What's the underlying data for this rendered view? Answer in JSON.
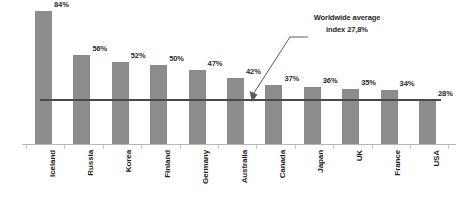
{
  "chart_data": {
    "type": "bar",
    "title": "",
    "subtitle": "",
    "xlabel": "",
    "ylabel": "",
    "ylim": [
      0,
      90
    ],
    "grid": false,
    "legend": null,
    "value_suffix": "%",
    "categories": [
      "Iceland",
      "Russia",
      "Korea",
      "Finland",
      "Germany",
      "Australia",
      "Canada",
      "Japan",
      "UK",
      "France",
      "USA"
    ],
    "values": [
      84,
      56,
      52,
      50,
      47,
      42,
      37,
      36,
      35,
      34,
      28
    ],
    "data_labels": [
      "84%",
      "56%",
      "52%",
      "50%",
      "47%",
      "42%",
      "37%",
      "36%",
      "35%",
      "34%",
      "28%"
    ],
    "series": [
      {
        "name": "",
        "color": "#8c8c8c",
        "values": [
          84,
          56,
          52,
          50,
          47,
          42,
          37,
          36,
          35,
          34,
          28
        ]
      }
    ],
    "reference_line": {
      "name": "worldwide-average",
      "value": 27.8,
      "label_line_1": "Worldwide average",
      "label_line_2": "index 27,8%",
      "color": "#4a4a4a"
    },
    "annotations": [
      {
        "name": "worldwide-average-callout",
        "text_line_1": "Worldwide average",
        "text_line_2": "index 27,8%",
        "points_to": "reference-line"
      }
    ],
    "colors": {
      "bar": "#8c8c8c",
      "reference_line": "#4a4a4a",
      "axis": "#b8b8b8",
      "text": "#1f1f1f",
      "background": "#ffffff"
    }
  }
}
